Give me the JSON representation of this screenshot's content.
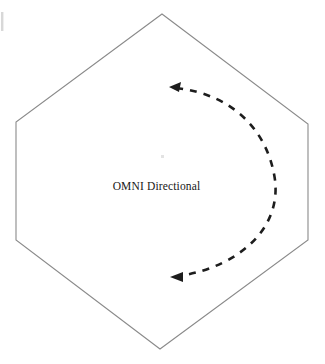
{
  "figure": {
    "title": "OMNI Directional",
    "background_color": "#ffffff",
    "width": 325,
    "height": 364
  },
  "label": {
    "text": "OMNI Directional",
    "color": "#171717"
  },
  "shapes": {
    "hexagon": {
      "name": "hexagon-outline",
      "stroke_color": "#8a8a8a",
      "fill_color": "#ffffff",
      "stroke_width": 1.1,
      "points": "162,14 308,124 308,240 160,349 16,240 16,122"
    },
    "arc": {
      "name": "omni-directional-arc",
      "style": "dashed",
      "stroke_color": "#1d1d1d",
      "stroke_width": 2.6,
      "dash_pattern": "7 7",
      "path": "M 176,88 C 232,94 268,130 275,180 C 281,228 240,266 180,276",
      "arrowheads": [
        {
          "name": "arrowhead-top",
          "direction": "left",
          "tip_x": 169,
          "tip_y": 87,
          "points": "169,87 181,82 179,92"
        },
        {
          "name": "arrowhead-bottom",
          "direction": "left",
          "tip_x": 170,
          "tip_y": 277,
          "points": "170,277 183,272 183,282"
        }
      ]
    },
    "artifacts": [
      {
        "name": "scan-artifact-left-edge",
        "x": 1,
        "y": 12,
        "width": 2.4,
        "height": 19,
        "color": "#d8d8d8"
      },
      {
        "name": "faint-speck-center",
        "x": 161,
        "y": 155,
        "width": 3,
        "height": 3,
        "color": "#e3e3e3"
      }
    ]
  }
}
